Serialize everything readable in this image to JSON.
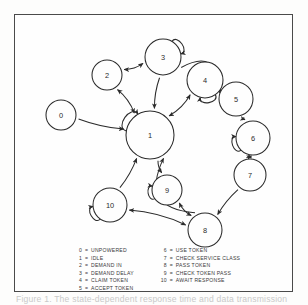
{
  "figure": {
    "caption": "Figure 1. The state-dependent response time and data transmission"
  },
  "legend": {
    "separator": "=",
    "left_column": [
      {
        "key": "0",
        "label": "UNPOWERED"
      },
      {
        "key": "1",
        "label": "IDLE"
      },
      {
        "key": "2",
        "label": "DEMAND IN"
      },
      {
        "key": "3",
        "label": "DEMAND DELAY"
      },
      {
        "key": "4",
        "label": "CLAIM TOKEN"
      },
      {
        "key": "5",
        "label": "ACCEPT TOKEN"
      }
    ],
    "right_column": [
      {
        "key": "6",
        "label": "USE TOKEN"
      },
      {
        "key": "7",
        "label": "CHECK SERVICE CLASS"
      },
      {
        "key": "8",
        "label": "PASS TOKEN"
      },
      {
        "key": "9",
        "label": "CHECK TOKEN PASS"
      },
      {
        "key": "10",
        "label": "AWAIT RESPONSE"
      }
    ]
  },
  "chart_data": {
    "type": "diagram",
    "subtype": "state-transition-graph",
    "colors": {
      "stroke": "#2b2b2b",
      "background": "#fefefe",
      "frame": "#4a4a4a"
    },
    "nodes": [
      {
        "id": "0",
        "label": "0",
        "name": "UNPOWERED",
        "cx": 46,
        "cy": 100,
        "r": 15
      },
      {
        "id": "1",
        "label": "1",
        "name": "IDLE",
        "cx": 135,
        "cy": 120,
        "r": 24
      },
      {
        "id": "2",
        "label": "2",
        "name": "DEMAND IN",
        "cx": 92,
        "cy": 60,
        "r": 15
      },
      {
        "id": "3",
        "label": "3",
        "name": "DEMAND DELAY",
        "cx": 148,
        "cy": 42,
        "r": 18
      },
      {
        "id": "4",
        "label": "4",
        "name": "CLAIM TOKEN",
        "cx": 190,
        "cy": 65,
        "r": 18
      },
      {
        "id": "5",
        "label": "5",
        "name": "ACCEPT TOKEN",
        "cx": 221,
        "cy": 84,
        "r": 17
      },
      {
        "id": "6",
        "label": "6",
        "name": "USE TOKEN",
        "cx": 238,
        "cy": 123,
        "r": 17
      },
      {
        "id": "7",
        "label": "7",
        "name": "CHECK SERVICE CLASS",
        "cx": 235,
        "cy": 160,
        "r": 16
      },
      {
        "id": "8",
        "label": "8",
        "name": "PASS TOKEN",
        "cx": 190,
        "cy": 215,
        "r": 17
      },
      {
        "id": "9",
        "label": "9",
        "name": "CHECK TOKEN PASS",
        "cx": 152,
        "cy": 175,
        "r": 15
      },
      {
        "id": "10",
        "label": "10",
        "name": "AWAIT RESPONSE",
        "cx": 95,
        "cy": 190,
        "r": 17
      }
    ],
    "self_loops": [
      {
        "node": "1",
        "angle": 215
      },
      {
        "node": "3",
        "angle": 325
      },
      {
        "node": "4",
        "angle": 80
      },
      {
        "node": "6",
        "angle": 160
      },
      {
        "node": "9",
        "angle": 170
      },
      {
        "node": "10",
        "angle": 150
      }
    ],
    "edges": [
      {
        "from": "0",
        "to": "1",
        "bidirectional": false
      },
      {
        "from": "1",
        "to": "2",
        "bidirectional": true
      },
      {
        "from": "2",
        "to": "3",
        "bidirectional": true
      },
      {
        "from": "3",
        "to": "1",
        "bidirectional": false
      },
      {
        "from": "1",
        "to": "4",
        "bidirectional": true
      },
      {
        "from": "3",
        "to": "5",
        "bidirectional": false,
        "curved": true
      },
      {
        "from": "4",
        "to": "5",
        "bidirectional": false
      },
      {
        "from": "5",
        "to": "6",
        "bidirectional": false
      },
      {
        "from": "6",
        "to": "7",
        "bidirectional": true
      },
      {
        "from": "7",
        "to": "8",
        "bidirectional": false
      },
      {
        "from": "8",
        "to": "1",
        "bidirectional": false,
        "curved": true
      },
      {
        "from": "1",
        "to": "9",
        "bidirectional": false
      },
      {
        "from": "9",
        "to": "8",
        "bidirectional": true
      },
      {
        "from": "8",
        "to": "10",
        "bidirectional": true
      },
      {
        "from": "10",
        "to": "1",
        "bidirectional": false
      }
    ]
  }
}
